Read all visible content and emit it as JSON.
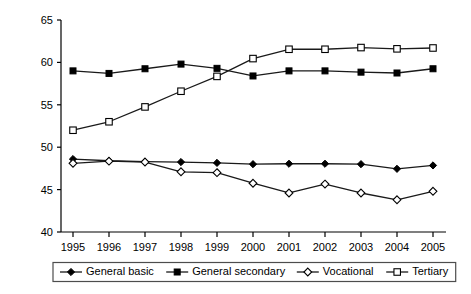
{
  "chart_data": {
    "type": "line",
    "title": "",
    "subtitle": "",
    "xlabel": "",
    "ylabel": "",
    "categories": [
      "1995",
      "1996",
      "1997",
      "1998",
      "1999",
      "2000",
      "2001",
      "2002",
      "2003",
      "2004",
      "2005"
    ],
    "x": [
      1995,
      1996,
      1997,
      1998,
      1999,
      2000,
      2001,
      2002,
      2003,
      2004,
      2005
    ],
    "ylim": [
      40,
      65
    ],
    "yticks": [
      40,
      45,
      50,
      55,
      60,
      65
    ],
    "ytick_labels": [
      "40",
      "45",
      "50",
      "55",
      "60",
      "65"
    ],
    "grid": false,
    "legend_position": "bottom",
    "series": [
      {
        "name": "General basic",
        "marker": "filled-diamond",
        "color": "#000000",
        "values": [
          48.6,
          48.4,
          48.3,
          48.25,
          48.15,
          48.0,
          48.05,
          48.05,
          48.0,
          47.45,
          47.85
        ]
      },
      {
        "name": "General secondary",
        "marker": "filled-square",
        "color": "#000000",
        "values": [
          59.0,
          58.7,
          59.25,
          59.8,
          59.3,
          58.4,
          59.0,
          59.0,
          58.85,
          58.75,
          59.25
        ]
      },
      {
        "name": "Vocational",
        "marker": "open-diamond",
        "color": "#000000",
        "values": [
          48.1,
          48.35,
          48.25,
          47.1,
          47.0,
          45.75,
          44.6,
          45.65,
          44.6,
          43.8,
          44.8
        ]
      },
      {
        "name": "Tertiary",
        "marker": "open-square",
        "color": "#000000",
        "values": [
          52.0,
          53.0,
          54.75,
          56.6,
          58.35,
          60.45,
          61.55,
          61.55,
          61.75,
          61.6,
          61.7
        ]
      }
    ]
  },
  "legend": {
    "items": [
      {
        "label": "General basic",
        "marker": "filled-diamond"
      },
      {
        "label": "General secondary",
        "marker": "filled-square"
      },
      {
        "label": "Vocational",
        "marker": "open-diamond"
      },
      {
        "label": "Tertiary",
        "marker": "open-square"
      }
    ]
  },
  "colors": {
    "line": "#1a1a1a",
    "axis": "#000000",
    "background": "#ffffff",
    "marker_fill_open": "#ffffff"
  }
}
